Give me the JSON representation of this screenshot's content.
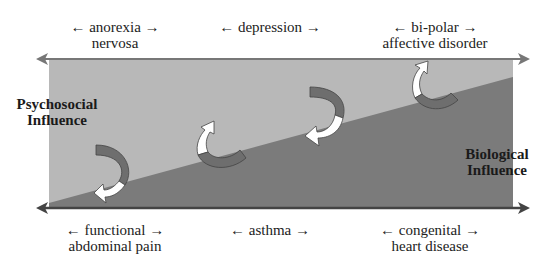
{
  "diagram": {
    "top_labels": [
      {
        "line1": "anorexia",
        "line2": "nervosa"
      },
      {
        "line1": "depression",
        "line2": ""
      },
      {
        "line1": "bi-polar",
        "line2": "affective disorder"
      }
    ],
    "bottom_labels": [
      {
        "line1": "functional",
        "line2": "abdominal pain"
      },
      {
        "line1": "asthma",
        "line2": ""
      },
      {
        "line1": "congenital",
        "line2": "heart disease"
      }
    ],
    "left_label": {
      "line1": "Psychosocial",
      "line2": "Influence"
    },
    "right_label": {
      "line1": "Biological",
      "line2": "Influence"
    },
    "arrow_left": "←",
    "arrow_right": "→",
    "colors": {
      "psychosocial_region": "#b8b8b8",
      "biological_region": "#7a7a7a",
      "axis_arrow": "#777777",
      "bottom_axis": "#444444"
    }
  }
}
